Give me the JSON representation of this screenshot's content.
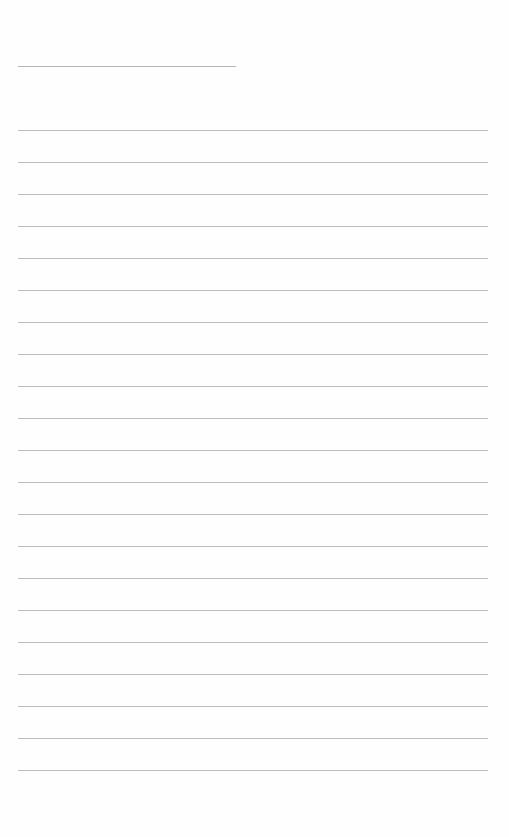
{
  "page": {
    "title_text": "",
    "line_color": "#bdbdbd",
    "background": "#ffffff",
    "title_line": {
      "x": 18,
      "y": 66,
      "width": 218
    },
    "ruled_lines": {
      "count": 21,
      "x": 18,
      "width": 470,
      "first_y": 130,
      "spacing": 32
    }
  }
}
